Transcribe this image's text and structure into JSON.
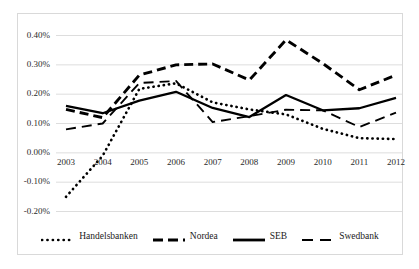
{
  "chart_data": {
    "type": "line",
    "title": "",
    "subtitle": "",
    "xlabel": "",
    "ylabel": "",
    "categories": [
      "2003",
      "2004",
      "2005",
      "2006",
      "2007",
      "2008",
      "2009",
      "2010",
      "2011",
      "2012"
    ],
    "x": [
      2003,
      2004,
      2005,
      2006,
      2007,
      2008,
      2009,
      2010,
      2011,
      2012
    ],
    "ylim": [
      -0.2,
      0.4
    ],
    "ytick_values": [
      0.4,
      0.3,
      0.2,
      0.1,
      0.0,
      -0.1,
      -0.2
    ],
    "ytick_labels": [
      "0.40%",
      "0.30%",
      "0.20%",
      "0.10%",
      "0.00%",
      "-0.10%",
      "-0.20%"
    ],
    "grid": true,
    "grid_axis": "y",
    "legend_position": "bottom",
    "value_unit": "percent",
    "series": [
      {
        "name": "Handelsbanken",
        "style": "dotted",
        "color": "#000000",
        "values": [
          -0.15,
          -0.01,
          0.218,
          0.237,
          0.172,
          0.148,
          0.131,
          0.082,
          0.05,
          0.047
        ]
      },
      {
        "name": "Nordea",
        "style": "dashed",
        "color": "#000000",
        "values": [
          0.148,
          0.12,
          0.265,
          0.3,
          0.303,
          0.248,
          0.385,
          0.305,
          0.215,
          0.265
        ]
      },
      {
        "name": "SEB",
        "style": "solid",
        "color": "#000000",
        "values": [
          0.16,
          0.135,
          0.178,
          0.208,
          0.153,
          0.122,
          0.197,
          0.145,
          0.152,
          0.187
        ]
      },
      {
        "name": "Swedbank",
        "style": "long-dash",
        "color": "#000000",
        "values": [
          0.08,
          0.1,
          0.238,
          0.245,
          0.105,
          0.125,
          0.147,
          0.145,
          0.088,
          0.137
        ]
      }
    ]
  },
  "legend": {
    "items": [
      {
        "label": "Handelsbanken",
        "icon": "dotted-line-swatch"
      },
      {
        "label": "Nordea",
        "icon": "dashed-line-swatch"
      },
      {
        "label": "SEB",
        "icon": "solid-line-swatch"
      },
      {
        "label": "Swedbank",
        "icon": "long-dash-line-swatch"
      }
    ]
  }
}
